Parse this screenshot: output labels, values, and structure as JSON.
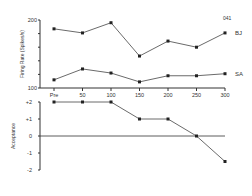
{
  "chart_data": [
    {
      "type": "line",
      "title": "",
      "annotation": "041",
      "xlabel": "",
      "ylabel": "Firing Rate (Spikes/s)",
      "ylim": [
        100,
        200
      ],
      "y_ticks": [
        "100",
        "200"
      ],
      "categories": [
        "Pre",
        "50",
        "100",
        "150",
        "200",
        "250",
        "300"
      ],
      "series": [
        {
          "name": "BJ",
          "values": [
            187,
            181,
            196,
            147,
            169,
            160,
            181
          ]
        },
        {
          "name": "SA",
          "values": [
            112,
            128,
            122,
            109,
            118,
            118,
            121
          ]
        }
      ],
      "grid": false
    },
    {
      "type": "line",
      "title": "",
      "xlabel": "",
      "ylabel": "Acceptance",
      "ylim": [
        -2,
        2
      ],
      "y_ticks": [
        "+2",
        "+1",
        "0",
        "-1",
        "-2"
      ],
      "categories": [
        "Pre",
        "50",
        "100",
        "150",
        "200",
        "250",
        "300"
      ],
      "series": [
        {
          "name": "Acceptance",
          "values": [
            2,
            2,
            2,
            1,
            1,
            0,
            -1.5
          ]
        }
      ],
      "zero_line": true,
      "grid": false
    }
  ]
}
